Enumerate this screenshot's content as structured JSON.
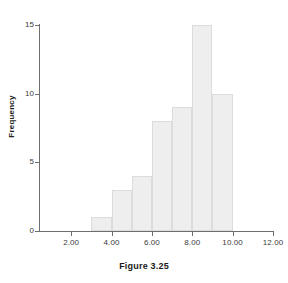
{
  "caption": "Figure 3.25",
  "chart_data": {
    "type": "bar",
    "title": "",
    "subtitle": "",
    "xlabel": "",
    "ylabel": "Frequency",
    "grid": false,
    "legend": "none",
    "xlim": [
      1,
      12
    ],
    "ylim": [
      0,
      15
    ],
    "bin_width": 1,
    "bin_edges": [
      3,
      4,
      5,
      6,
      7,
      8,
      9,
      10
    ],
    "categories": [
      "3-4",
      "4-5",
      "5-6",
      "6-7",
      "7-8",
      "8-9",
      "9-10"
    ],
    "values": [
      1,
      3,
      4,
      8,
      9,
      15,
      10
    ],
    "bars": [
      {
        "start": 3,
        "end": 4,
        "value": 1
      },
      {
        "start": 4,
        "end": 5,
        "value": 3
      },
      {
        "start": 5,
        "end": 6,
        "value": 4
      },
      {
        "start": 6,
        "end": 7,
        "value": 8
      },
      {
        "start": 7,
        "end": 8,
        "value": 9
      },
      {
        "start": 8,
        "end": 9,
        "value": 15
      },
      {
        "start": 9,
        "end": 10,
        "value": 10
      }
    ],
    "x_ticks": [
      2,
      4,
      6,
      8,
      10,
      12
    ],
    "x_tick_labels": [
      "2.00",
      "4.00",
      "6.00",
      "8.00",
      "10.00",
      "12.00"
    ],
    "y_ticks": [
      0,
      5,
      10,
      15
    ],
    "y_tick_labels": [
      "0",
      "5",
      "10",
      "15"
    ],
    "colors": {
      "bar_fill": "#eeeeee",
      "bar_edge": "#dcdcdc",
      "axis": "#6e6e6e",
      "text": "#1a1a1a",
      "background": "#ffffff"
    }
  }
}
